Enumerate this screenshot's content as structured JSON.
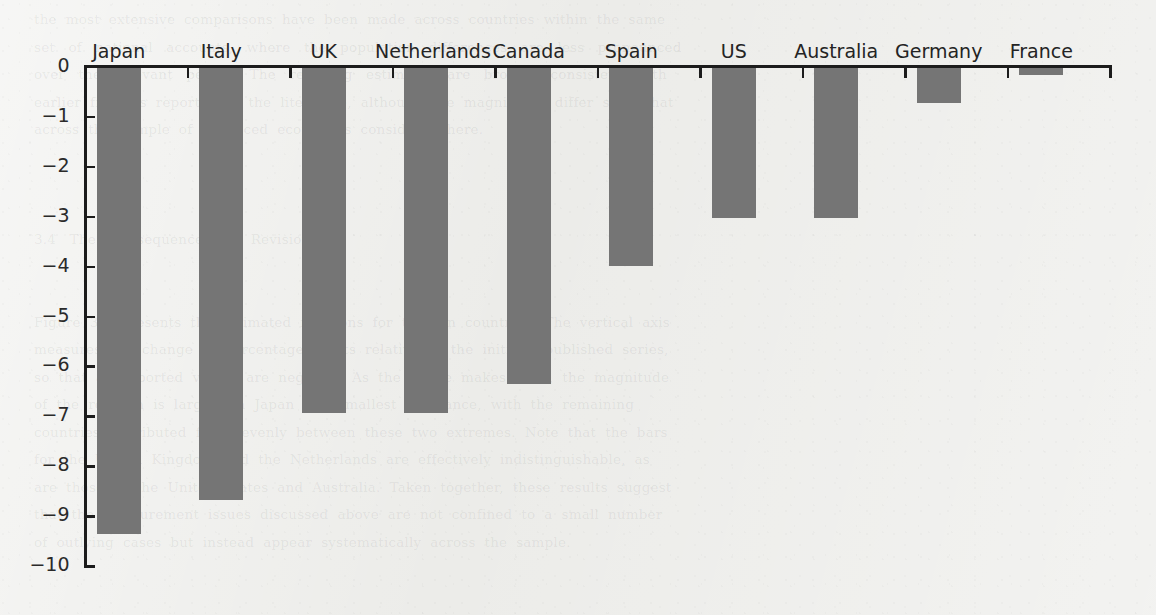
{
  "chart_data": {
    "type": "bar",
    "title": "",
    "subtitle": "",
    "xlabel": "",
    "ylabel": "",
    "categories": [
      "Japan",
      "Italy",
      "UK",
      "Netherlands",
      "Canada",
      "Spain",
      "US",
      "Australia",
      "Germany",
      "France"
    ],
    "values": [
      -9.34,
      -8.66,
      -6.91,
      -6.91,
      -6.33,
      -3.97,
      -3.01,
      -3.01,
      -0.7,
      -0.15
    ],
    "ylim": [
      -10,
      0
    ],
    "yticks": [
      0,
      -1,
      -2,
      -3,
      -4,
      -5,
      -6,
      -7,
      -8,
      -9,
      -10
    ],
    "ytick_labels": [
      "0",
      "−1",
      "−2",
      "−3",
      "−4",
      "−5",
      "−6",
      "−7",
      "−8",
      "−9",
      "−10"
    ],
    "grid": false,
    "legend": null,
    "legend_position": "none",
    "bar_color": "#757575",
    "axis_color": "#1c1c1c",
    "category_labels_position": "top",
    "annotations": []
  },
  "page": {
    "background_color": "#ecece9",
    "bleed_through_lines": [
      "the  most  extensive  comparisons  have  been  made  across  countries  within  the  same",
      "set   of   national   accounts,   where   the   population   differences   are   less   pronounced",
      "over   the   relevant   period.   The   resulting   estimates   are   broadly   consistent   with",
      "earlier  findings  reported  in  the  literature,  although  the  magnitudes  differ  somewhat",
      "across  the  sample  of  advanced  economies  considered  here.",
      "",
      "",
      "",
      "3.4   The   Consequences   of   Revisions",
      "",
      "",
      "Figure  3.1  presents  the  estimated  revisions  for  the  ten  countries.  The  vertical  axis",
      "measures  the  change  in  percentage  points  relative  to  the  initially  published  series,",
      "so  that  all  reported  values  are  negative.  As  the  figure  makes  clear,  the  magnitude",
      "of  the  revision  is  largest  in  Japan  and  smallest  in  France,  with  the  remaining",
      "countries  distributed  fairly  evenly  between  these  two  extremes.  Note  that  the  bars",
      "for  the  United  Kingdom  and  the  Netherlands  are  effectively  indistinguishable,  as",
      "are  those  of  the  United  States  and  Australia.  Taken  together,  these  results  suggest",
      "that  the  measurement  issues  discussed  above  are  not  confined  to  a  small  number",
      "of  outlying  cases  but  instead  appear  systematically  across  the  sample."
    ]
  }
}
